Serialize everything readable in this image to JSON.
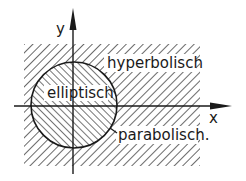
{
  "diagram": {
    "axes": {
      "x_label": "x",
      "y_label": "y"
    },
    "regions": [
      {
        "id": "hyperbolic",
        "label": "hyperbolisch",
        "hatch": "backslash"
      },
      {
        "id": "elliptic",
        "label": "elliptisch",
        "hatch": "slash"
      },
      {
        "id": "parabolic",
        "label": "parabolisch.",
        "hatch": "boundary"
      }
    ],
    "colors": {
      "ink": "#1a1a1a",
      "background": "#ffffff"
    }
  }
}
